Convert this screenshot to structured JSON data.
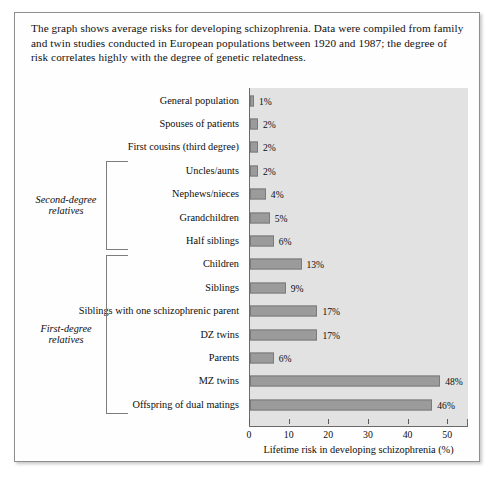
{
  "caption": "The graph shows average risks for developing schizophrenia. Data were compiled from family and twin studies conducted in European populations between 1920 and 1987; the degree of risk correlates highly with the degree of genetic relatedness.",
  "groups": [
    {
      "label": "Second-degree relatives",
      "first": 3,
      "last": 6
    },
    {
      "label": "First-degree relatives",
      "first": 7,
      "last": 13
    }
  ],
  "chart_data": {
    "type": "bar",
    "orientation": "horizontal",
    "title": "",
    "xlabel": "Lifetime risk in developing schizophrenia (%)",
    "ylabel": "",
    "xlim": [
      0,
      55
    ],
    "xticks": [
      0,
      10,
      20,
      30,
      40,
      50
    ],
    "xtick_labels": [
      "0",
      "10",
      "20",
      "30",
      "40",
      "50"
    ],
    "grid": false,
    "legend": "none",
    "bar_color": "#9b9b9b",
    "plot_background": "#e2e2e2",
    "categories": [
      "General population",
      "Spouses of patients",
      "First cousins (third degree)",
      "Uncles/aunts",
      "Nephews/nieces",
      "Grandchildren",
      "Half siblings",
      "Children",
      "Siblings",
      "Siblings with one schizophrenic parent",
      "DZ twins",
      "Parents",
      "MZ twins",
      "Offspring of dual matings"
    ],
    "values": [
      1,
      2,
      2,
      2,
      4,
      5,
      6,
      13,
      9,
      17,
      17,
      6,
      48,
      46
    ],
    "value_labels": [
      "1%",
      "2%",
      "2%",
      "2%",
      "4%",
      "5%",
      "6%",
      "13%",
      "9%",
      "17%",
      "17%",
      "6%",
      "48%",
      "46%"
    ]
  }
}
